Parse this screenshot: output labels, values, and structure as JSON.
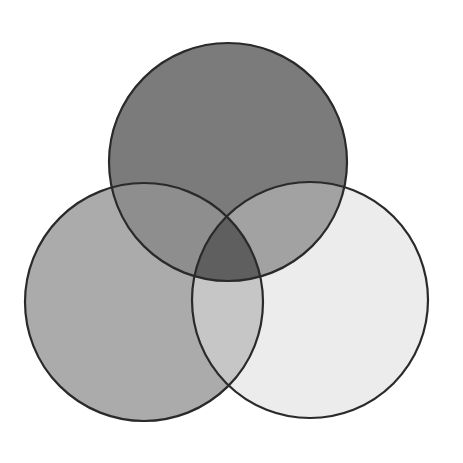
{
  "diagram": {
    "type": "venn-3",
    "background": "#ffffff",
    "stroke_color": "#2a2a2a",
    "stroke_width": 2.2,
    "circles": [
      {
        "id": "top",
        "cx": 228,
        "cy": 162,
        "r": 119
      },
      {
        "id": "left",
        "cx": 144,
        "cy": 302,
        "r": 119
      },
      {
        "id": "right",
        "cx": 310,
        "cy": 300,
        "r": 118
      }
    ],
    "regions": {
      "top_only": "#7b7b7b",
      "left_only": "#ababab",
      "right_only": "#ececec",
      "top_left": "#8e8e8e",
      "top_right": "#a2a2a2",
      "left_right": "#c6c6c6",
      "center": "#5f5f5f"
    },
    "labels": []
  }
}
